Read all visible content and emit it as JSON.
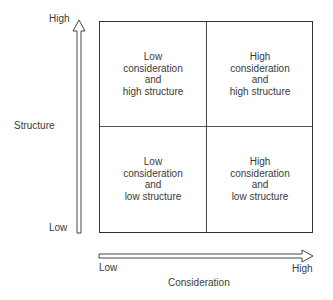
{
  "y_axis": {
    "label": "Structure",
    "high_label": "High",
    "low_label": "Low"
  },
  "x_axis": {
    "label": "Consideration",
    "low_label": "Low",
    "high_label": "High"
  },
  "quadrants": {
    "top_left": {
      "line1": "Low",
      "line2": "consideration",
      "line3": "and",
      "line4": "high structure"
    },
    "top_right": {
      "line1": "High",
      "line2": "consideration",
      "line3": "and",
      "line4": "high structure"
    },
    "bottom_left": {
      "line1": "Low",
      "line2": "consideration",
      "line3": "and",
      "line4": "low structure"
    },
    "bottom_right": {
      "line1": "High",
      "line2": "consideration",
      "line3": "and",
      "line4": "low structure"
    }
  },
  "colors": {
    "line": "#333333",
    "text": "#3a3a3a",
    "background": "#ffffff"
  }
}
